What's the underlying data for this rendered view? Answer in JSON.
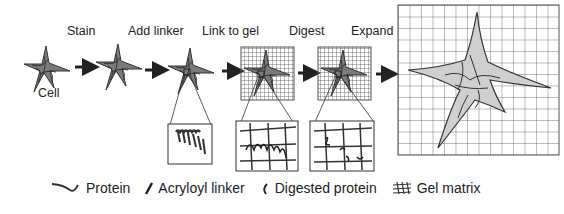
{
  "steps": [
    {
      "id": "cell",
      "label": "Cell"
    },
    {
      "id": "stain",
      "label": "Stain"
    },
    {
      "id": "add-linker",
      "label": "Add linker"
    },
    {
      "id": "link-to-gel",
      "label": "Link to gel"
    },
    {
      "id": "digest",
      "label": "Digest"
    },
    {
      "id": "expand",
      "label": "Expand"
    }
  ],
  "legend": [
    {
      "icon": "protein-icon",
      "label": "Protein"
    },
    {
      "icon": "acryloyl-linker-icon",
      "label": "Acryloyl linker"
    },
    {
      "icon": "digested-protein-icon",
      "label": "Digested protein"
    },
    {
      "icon": "gel-matrix-icon",
      "label": "Gel matrix"
    }
  ],
  "colors": {
    "stroke": "#333333",
    "cell_fill": "#8a8a8a",
    "expanded_fill": "#cfcfcf",
    "grid": "#555555"
  }
}
